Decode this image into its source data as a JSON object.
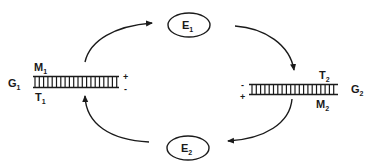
{
  "diagram": {
    "type": "cyclic exchange scheme",
    "nodes": {
      "E1": {
        "label": "E",
        "subscript": "1"
      },
      "E2": {
        "label": "E",
        "subscript": "2"
      }
    },
    "duplexes": {
      "left": {
        "name": {
          "label": "G",
          "subscript": "1"
        },
        "top_strand": {
          "label": "M",
          "subscript": "1"
        },
        "bottom_strand": {
          "label": "T",
          "subscript": "1"
        },
        "charge_top": "+",
        "charge_bottom": "-"
      },
      "right": {
        "name": {
          "label": "G",
          "subscript": "2"
        },
        "top_strand": {
          "label": "T",
          "subscript": "2"
        },
        "bottom_strand": {
          "label": "M",
          "subscript": "2"
        },
        "charge_top": "-",
        "charge_bottom": "+"
      }
    },
    "edges": [
      {
        "from": "G1",
        "to": "E1",
        "direction": "up-right"
      },
      {
        "from": "E1",
        "to": "G2",
        "direction": "down-right"
      },
      {
        "from": "G2",
        "to": "E2",
        "direction": "down-left"
      },
      {
        "from": "E2",
        "to": "G1",
        "direction": "up-left"
      }
    ],
    "colors": {
      "ink": "#1a1a1a",
      "background": "#ffffff"
    }
  }
}
